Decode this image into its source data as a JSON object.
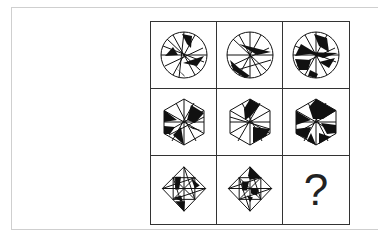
{
  "puzzle": {
    "rows": [
      {
        "shape": "circle",
        "cells": [
          "circle-figure-1",
          "circle-figure-2",
          "circle-figure-3"
        ]
      },
      {
        "shape": "hexagon",
        "cells": [
          "hexagon-figure-1",
          "hexagon-figure-2",
          "hexagon-figure-3"
        ]
      },
      {
        "shape": "diamond",
        "cells": [
          "diamond-figure-1",
          "diamond-figure-2",
          "missing"
        ]
      }
    ],
    "missing_symbol": "?"
  },
  "colors": {
    "stroke": "#111111",
    "fill": "#111111",
    "grid_border": "#333333",
    "frame_border": "#cfcfcf"
  }
}
